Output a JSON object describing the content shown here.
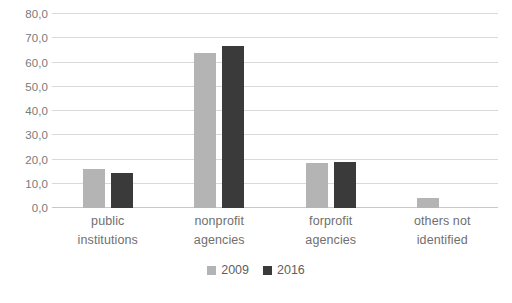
{
  "chart_data": {
    "type": "bar",
    "title": "",
    "subtitle": "",
    "xlabel": "",
    "ylabel": "",
    "grid": true,
    "legend_position": "bottom-center",
    "categories": [
      "public institutions",
      "nonprofit agencies",
      "forprofit agencies",
      "others not identified"
    ],
    "category_lines": [
      [
        "public",
        "institutions"
      ],
      [
        "nonprofit",
        "agencies"
      ],
      [
        "forprofit",
        "agencies"
      ],
      [
        "others not",
        "identified"
      ]
    ],
    "series": [
      {
        "name": "2009",
        "color": "#b4b4b4",
        "values": [
          16.0,
          64.0,
          18.5,
          4.0
        ]
      },
      {
        "name": "2016",
        "color": "#3a3a3a",
        "values": [
          14.5,
          67.0,
          19.0,
          0.0
        ]
      }
    ],
    "ylim": [
      0,
      80
    ],
    "ytick_step": 10,
    "ytick_labels": [
      "80,0",
      "70,0",
      "60,0",
      "50,0",
      "40,0",
      "30,0",
      "20,0",
      "10,0",
      "0,0"
    ],
    "ytick_values": [
      80,
      70,
      60,
      50,
      40,
      30,
      20,
      10,
      0
    ]
  },
  "legend": {
    "items": [
      {
        "label": "2009",
        "color": "#b4b4b4"
      },
      {
        "label": "2016",
        "color": "#3a3a3a"
      }
    ]
  },
  "colors": {
    "series_2009": "#b4b4b4",
    "series_2016": "#3a3a3a",
    "gridline": "#d9d9d9",
    "axis_text": "#7a7a7a",
    "background": "#ffffff"
  }
}
